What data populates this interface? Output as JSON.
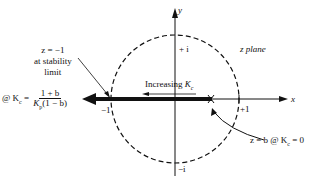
{
  "diagram": {
    "title": "z plane",
    "axes": {
      "x_label": "x",
      "y_label": "y",
      "ticks": {
        "plus_one": "+1",
        "minus_one": "−1",
        "plus_i": "+ i",
        "minus_i": "−i"
      }
    },
    "annotations": {
      "stability_line1": "z = −1",
      "stability_line2": "at stability",
      "stability_line3": "limit",
      "kc_prefix": "@ K",
      "kc_sub": "c",
      "kc_eq": " = ",
      "frac_num": "1 + b",
      "frac_den_k": "K",
      "frac_den_sub": "p",
      "frac_den_rest": "(1 − b)",
      "increasing_prefix": "Increasing ",
      "increasing_k": "K",
      "increasing_sub": "c",
      "start_point": "z = b @ K",
      "start_sub": "c",
      "start_tail": " = 0"
    },
    "colors": {
      "ink": "#111111",
      "background": "#ffffff"
    }
  }
}
